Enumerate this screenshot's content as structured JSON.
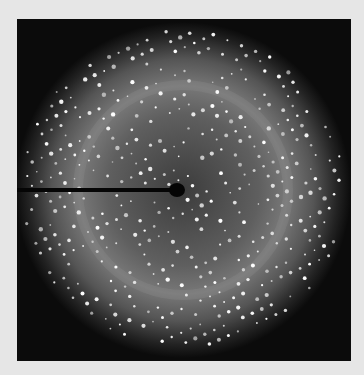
{
  "image": {
    "subject": "X-ray diffraction pattern",
    "description": "Circular diffraction pattern with a lattice of bright Bragg spots on a dark background, beam stop entering from the left to the center",
    "colors": {
      "background": "#e6e6e6",
      "frame": "#0b0b0b",
      "spot": "#ffffff",
      "halo": "#787878"
    }
  }
}
